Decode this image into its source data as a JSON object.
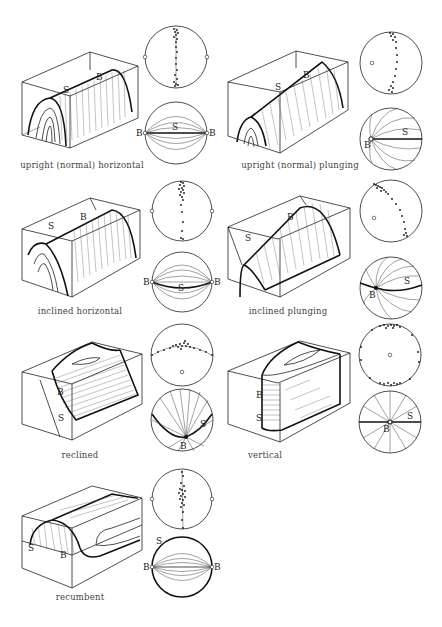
{
  "figure": {
    "panels": [
      {
        "id": "upright-horizontal",
        "caption": "upright (normal) horizontal",
        "labels": {
          "s": "S",
          "b": "B"
        }
      },
      {
        "id": "upright-plunging",
        "caption": "upright (normal) plunging",
        "labels": {
          "s": "S",
          "b": "B"
        }
      },
      {
        "id": "inclined-horizontal",
        "caption": "inclined horizontal",
        "labels": {
          "s": "S",
          "b": "B"
        }
      },
      {
        "id": "inclined-plunging",
        "caption": "inclined plunging",
        "labels": {
          "s": "S",
          "b": "B"
        }
      },
      {
        "id": "reclined",
        "caption": "reclined",
        "labels": {
          "s": "S",
          "b": "B"
        }
      },
      {
        "id": "vertical",
        "caption": "vertical",
        "labels": {
          "s": "S",
          "b": "B"
        }
      },
      {
        "id": "recumbent",
        "caption": "recumbent",
        "labels": {
          "s": "S",
          "b": "B"
        }
      }
    ]
  }
}
